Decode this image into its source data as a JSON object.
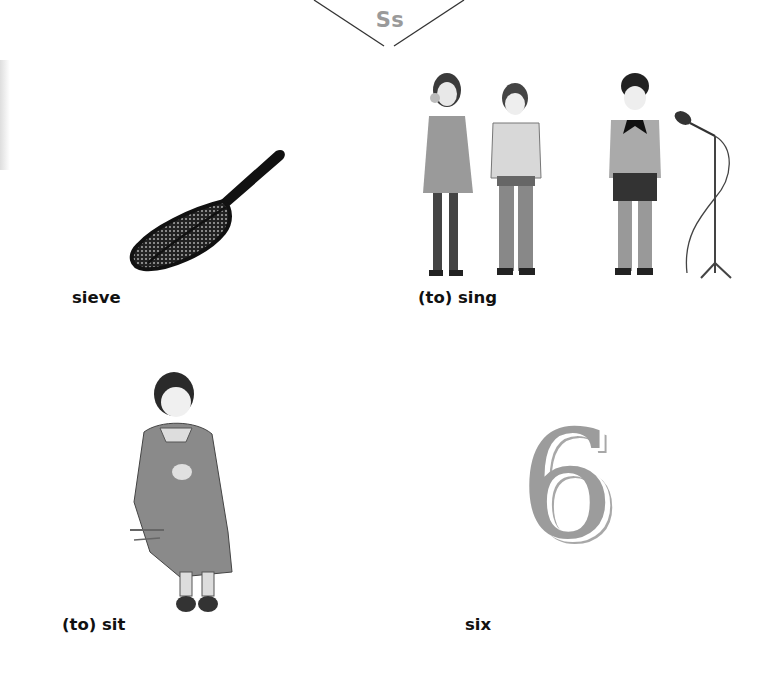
{
  "page": {
    "letter_heading": "Ss"
  },
  "entries": [
    {
      "english": "sieve",
      "irish": "criathar",
      "pronunciation": "k'r'ee-ahur",
      "illustration": "sieve-illustration"
    },
    {
      "english": "(to) sing",
      "irish": "can",
      "pronunciation": "kon",
      "illustration": "children-singing-illustration"
    },
    {
      "english": "(to) sit",
      "irish": "suigh",
      "pronunciation": "see",
      "illustration": "girl-sitting-illustration"
    },
    {
      "english": "six",
      "irish": "sé",
      "pronunciation": "shay",
      "illustration": "number-six-illustration",
      "numeral": "6"
    }
  ],
  "colors": {
    "heading": "#9a9a9a",
    "numeral": "#9c9c9c",
    "text": "#111111"
  }
}
